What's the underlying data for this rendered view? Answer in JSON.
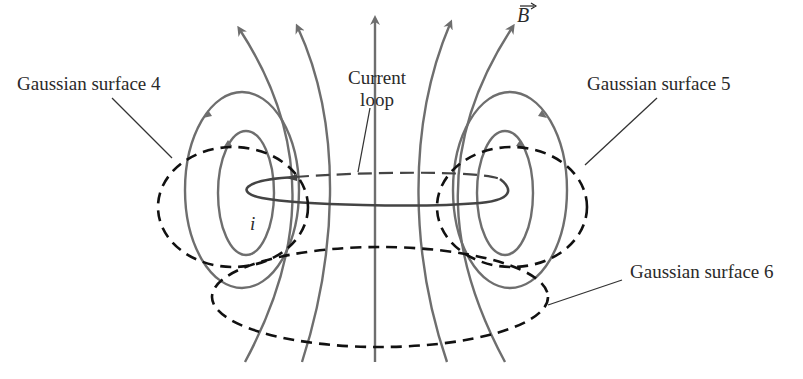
{
  "figure": {
    "colors": {
      "field_line": "#6e6e6e",
      "gaussian_surface": "#111111",
      "current_loop": "#555555",
      "leader_line": "#333333",
      "text": "#2a2a2a"
    }
  },
  "labels": {
    "surface4": "Gaussian surface 4",
    "surface5": "Gaussian surface 5",
    "surface6": "Gaussian surface 6",
    "current_loop_line1": "Current",
    "current_loop_line2": "loop",
    "field_symbol": "B",
    "current_symbol": "i"
  }
}
